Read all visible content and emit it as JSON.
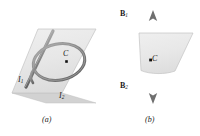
{
  "figure": {
    "type": "physics-diagram",
    "panels": [
      {
        "id": "a",
        "caption": "(a)",
        "plane": {
          "fill": "#e9e9e9",
          "stroke": "#b8b8b8"
        },
        "labels": [
          {
            "name": "current-i1",
            "text": "I",
            "sub": "1"
          },
          {
            "name": "current-i2",
            "text": "I",
            "sub": "2"
          },
          {
            "name": "center-point-c",
            "text": "C"
          }
        ]
      },
      {
        "id": "b",
        "caption": "(b)",
        "plane": {
          "fill": "#e9e9e9",
          "stroke": "#b8b8b8"
        },
        "labels": [
          {
            "name": "field-b1",
            "text": "B",
            "sub": "1",
            "direction": "up"
          },
          {
            "name": "field-b2",
            "text": "B",
            "sub": "2",
            "direction": "down"
          },
          {
            "name": "center-point-c",
            "text": "C"
          }
        ]
      }
    ],
    "labels": {
      "i1": "I",
      "i1_sub": "1",
      "i2": "I",
      "i2_sub": "2",
      "c_a": "C",
      "c_b": "C",
      "b1": "B",
      "b1_sub": "1",
      "b2": "B",
      "b2_sub": "2",
      "caption_a": "(a)",
      "caption_b": "(b)"
    },
    "colors": {
      "plane_fill": "#e9e9e9",
      "plane_edge": "#bcbcbc",
      "wire": "#8d8d8d",
      "wire_dark": "#6e6e6e",
      "arrow": "#7a7a7a",
      "dot": "#111111",
      "text": "#1a1a1a",
      "background": "#ffffff"
    }
  }
}
